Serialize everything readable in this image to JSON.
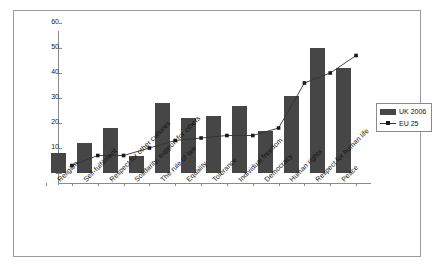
{
  "chart_data": {
    "type": "bar",
    "title": "",
    "subtitle": "",
    "xlabel": "",
    "ylabel": "",
    "ylim": [
      0,
      60
    ],
    "yticks": [
      0,
      10,
      20,
      30,
      40,
      50,
      60
    ],
    "grid": false,
    "legend_position": "right",
    "categories": [
      "Religion",
      "Self-fulfilment",
      "Respect for other cultures",
      "Solidarity, support for others",
      "The rule of law",
      "Equality",
      "Tolerance",
      "Individual freedom",
      "Democracy",
      "Human rights",
      "Respect for human life",
      "Peace"
    ],
    "series": [
      {
        "name": "UK 2006",
        "type": "bar",
        "color": "#464646",
        "values": [
          8,
          12,
          18,
          7,
          28,
          22,
          23,
          27,
          17,
          31,
          50,
          42
        ]
      },
      {
        "name": "EU 25",
        "type": "line",
        "color": "#333333",
        "values": [
          7,
          11,
          11,
          14,
          17,
          18,
          19,
          19,
          22,
          40,
          44,
          51
        ]
      }
    ]
  },
  "legend": {
    "items": [
      {
        "label": "UK 2006",
        "marker": "bar-swatch"
      },
      {
        "label": "EU 25",
        "marker": "line-marker"
      }
    ]
  },
  "axis": {
    "y_tick_labels": [
      "0",
      "10",
      "20",
      "30",
      "40",
      "50",
      "60"
    ]
  },
  "colors": {
    "bar": "#464646",
    "line": "#333333",
    "axis": "#8a8a8a",
    "frame": "#9a9a9a",
    "background": "#ffffff",
    "text": "#111111"
  }
}
